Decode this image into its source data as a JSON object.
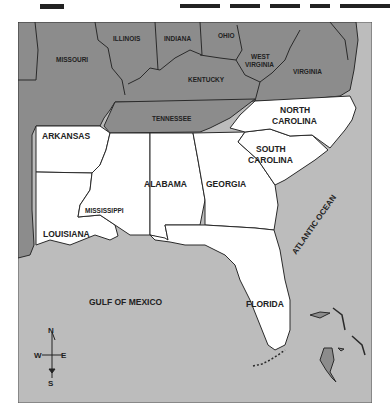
{
  "title_fragment": "SOUTH",
  "colors": {
    "water": "#bcbcbc",
    "other_states": "#8c8c8c",
    "southern_states": "#ffffff",
    "border": "#2a2a2a",
    "label": "#222222"
  },
  "other_states": [
    {
      "name": "MISSOURI"
    },
    {
      "name": "ILLINOIS"
    },
    {
      "name": "INDIANA"
    },
    {
      "name": "OHIO"
    },
    {
      "name": "WEST VIRGINIA",
      "line1": "WEST",
      "line2": "VIRGINIA"
    },
    {
      "name": "KENTUCKY"
    },
    {
      "name": "VIRGINIA"
    },
    {
      "name": "TENNESSEE"
    }
  ],
  "southern_states": [
    {
      "name": "ARKANSAS"
    },
    {
      "name": "NORTH CAROLINA",
      "line1": "NORTH",
      "line2": "CAROLINA"
    },
    {
      "name": "SOUTH CAROLINA",
      "line1": "SOUTH",
      "line2": "CAROLINA"
    },
    {
      "name": "ALABAMA"
    },
    {
      "name": "GEORGIA"
    },
    {
      "name": "MISSISSIPPI"
    },
    {
      "name": "LOUISIANA"
    },
    {
      "name": "FLORIDA"
    }
  ],
  "water_bodies": [
    {
      "name": "ATLANTIC OCEAN"
    },
    {
      "name": "GULF OF MEXICO"
    }
  ],
  "compass": {
    "n": "N",
    "s": "S",
    "e": "E",
    "w": "W"
  }
}
